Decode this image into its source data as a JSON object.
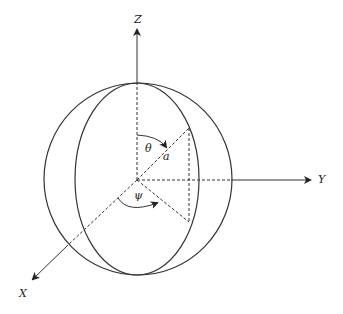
{
  "diagram": {
    "axes": {
      "z_label": "Z",
      "y_label": "Y",
      "x_label": "X"
    },
    "angles": {
      "polar_label": "θ",
      "azimuth_label": "ψ"
    },
    "radius_label": "a",
    "colors": {
      "stroke": "#333333",
      "background": "#ffffff"
    }
  }
}
